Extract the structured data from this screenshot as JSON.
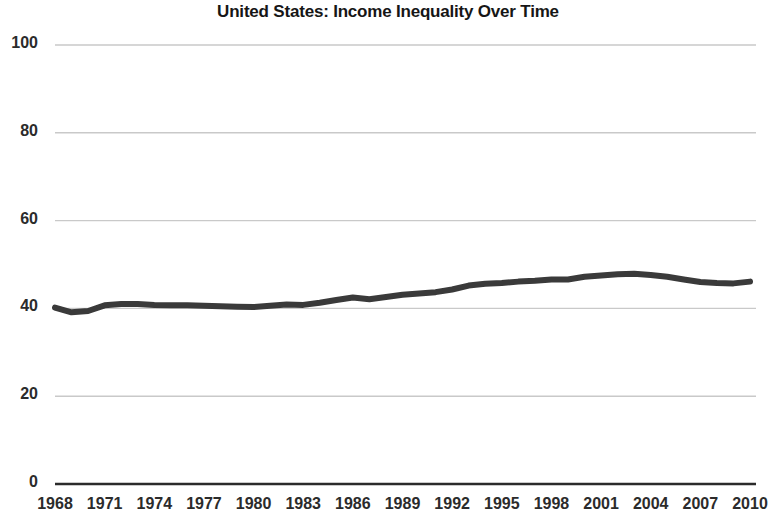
{
  "chart_data": {
    "type": "line",
    "title": "United States: Income Inequality Over Time",
    "xlabel": "",
    "ylabel": "",
    "xlim": [
      1968,
      2010
    ],
    "ylim": [
      0,
      100
    ],
    "grid": true,
    "legend": "none",
    "line_color": "#3a3a3a",
    "grid_color": "#c9c9c9",
    "axis_color": "#2b2b2b",
    "y_ticks": [
      "0",
      "20",
      "40",
      "60",
      "80",
      "100"
    ],
    "y_tick_values": [
      0,
      20,
      40,
      60,
      80,
      100
    ],
    "x_ticks": [
      "1968",
      "1971",
      "1974",
      "1977",
      "1980",
      "1983",
      "1986",
      "1989",
      "1992",
      "1995",
      "1998",
      "2001",
      "2004",
      "2007",
      "2010"
    ],
    "x_tick_values": [
      1968,
      1971,
      1974,
      1977,
      1980,
      1983,
      1986,
      1989,
      1992,
      1995,
      1998,
      2001,
      2004,
      2007,
      2010
    ],
    "series": [
      {
        "name": "Income inequality index",
        "x": [
          1968,
          1969,
          1970,
          1971,
          1972,
          1973,
          1974,
          1975,
          1976,
          1977,
          1978,
          1979,
          1980,
          1981,
          1982,
          1983,
          1984,
          1985,
          1986,
          1987,
          1988,
          1989,
          1990,
          1991,
          1992,
          1993,
          1994,
          1995,
          1996,
          1997,
          1998,
          1999,
          2000,
          2001,
          2002,
          2003,
          2004,
          2005,
          2006,
          2007,
          2008,
          2009,
          2010
        ],
        "values": [
          40.2,
          39.1,
          39.4,
          40.7,
          41.0,
          41.0,
          40.8,
          40.7,
          40.7,
          40.6,
          40.5,
          40.4,
          40.3,
          40.6,
          40.9,
          40.8,
          41.3,
          41.9,
          42.5,
          42.1,
          42.6,
          43.1,
          43.4,
          43.7,
          44.3,
          45.2,
          45.6,
          45.8,
          46.1,
          46.3,
          46.6,
          46.6,
          47.2,
          47.5,
          47.8,
          47.9,
          47.6,
          47.2,
          46.6,
          46.0,
          45.8,
          45.7,
          46.1
        ]
      }
    ]
  }
}
